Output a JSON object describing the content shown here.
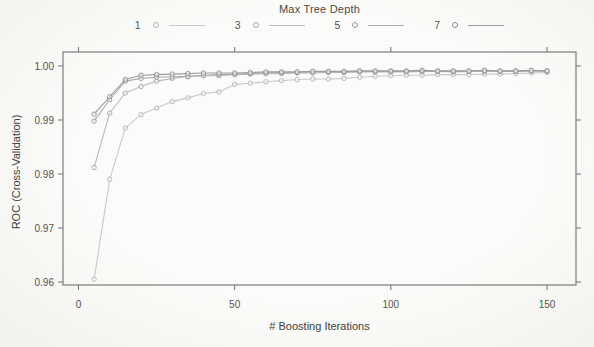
{
  "figure": {
    "legend_title": "Max Tree Depth",
    "xlabel": "# Boosting Iterations",
    "ylabel": "ROC (Cross-Validation)"
  },
  "chart_data": {
    "type": "line",
    "title": "",
    "legend_title": "Max Tree Depth",
    "legend_position": "top",
    "xlabel": "# Boosting Iterations",
    "ylabel": "ROC (Cross-Validation)",
    "grid": false,
    "point_shape": "open-circle",
    "xlim": [
      -5,
      159
    ],
    "ylim": [
      0.9594,
      1.0026
    ],
    "xticks": [
      0,
      50,
      100,
      150
    ],
    "xtick_labels": [
      "0",
      "50",
      "100",
      "150"
    ],
    "yticks": [
      0.96,
      0.97,
      0.98,
      0.99,
      1.0
    ],
    "ytick_labels": [
      "0.96",
      "0.97",
      "0.98",
      "0.99",
      "1.00"
    ],
    "x": [
      5,
      10,
      15,
      20,
      25,
      30,
      35,
      40,
      45,
      50,
      55,
      60,
      65,
      70,
      75,
      80,
      85,
      90,
      95,
      100,
      105,
      110,
      115,
      120,
      125,
      130,
      135,
      140,
      145,
      150
    ],
    "series": [
      {
        "name": "1",
        "line_color": "#c7cacb",
        "marker_color": "#b2b6b8",
        "values": [
          0.9605,
          0.979,
          0.9885,
          0.991,
          0.9922,
          0.9934,
          0.9941,
          0.9949,
          0.9952,
          0.9966,
          0.9968,
          0.9971,
          0.9973,
          0.9975,
          0.9976,
          0.9976,
          0.9977,
          0.9979,
          0.9981,
          0.9982,
          0.9983,
          0.9983,
          0.9984,
          0.9984,
          0.9984,
          0.9985,
          0.9985,
          0.9986,
          0.9987,
          0.9988
        ]
      },
      {
        "name": "3",
        "line_color": "#b9bcbe",
        "marker_color": "#a4a8aa",
        "values": [
          0.9812,
          0.9913,
          0.995,
          0.9962,
          0.9972,
          0.9977,
          0.998,
          0.9982,
          0.9982,
          0.9984,
          0.9985,
          0.9986,
          0.9986,
          0.9987,
          0.9987,
          0.9988,
          0.9988,
          0.9989,
          0.9989,
          0.9989,
          0.9989,
          0.999,
          0.999,
          0.9989,
          0.999,
          0.999,
          0.999,
          0.999,
          0.9991,
          0.999
        ]
      },
      {
        "name": "5",
        "line_color": "#a8acae",
        "marker_color": "#95999c",
        "values": [
          0.9898,
          0.9938,
          0.9972,
          0.9977,
          0.9979,
          0.998,
          0.9981,
          0.9983,
          0.9984,
          0.9985,
          0.9986,
          0.9987,
          0.9988,
          0.9988,
          0.9989,
          0.9989,
          0.9989,
          0.999,
          0.999,
          0.999,
          0.999,
          0.999,
          0.999,
          0.999,
          0.999,
          0.9991,
          0.999,
          0.999,
          0.9991,
          0.9991
        ]
      },
      {
        "name": "7",
        "line_color": "#9a9ea1",
        "marker_color": "#8a8e91",
        "values": [
          0.9911,
          0.9943,
          0.9975,
          0.9983,
          0.9984,
          0.9985,
          0.9986,
          0.9987,
          0.9987,
          0.9987,
          0.9988,
          0.9989,
          0.9989,
          0.9989,
          0.999,
          0.999,
          0.999,
          0.9991,
          0.9991,
          0.9991,
          0.9991,
          0.9992,
          0.9991,
          0.9991,
          0.9991,
          0.9992,
          0.9991,
          0.9991,
          0.9992,
          0.9991
        ]
      }
    ],
    "axis_color": "#7b7d7c",
    "tick_label_color": "#55554f"
  }
}
